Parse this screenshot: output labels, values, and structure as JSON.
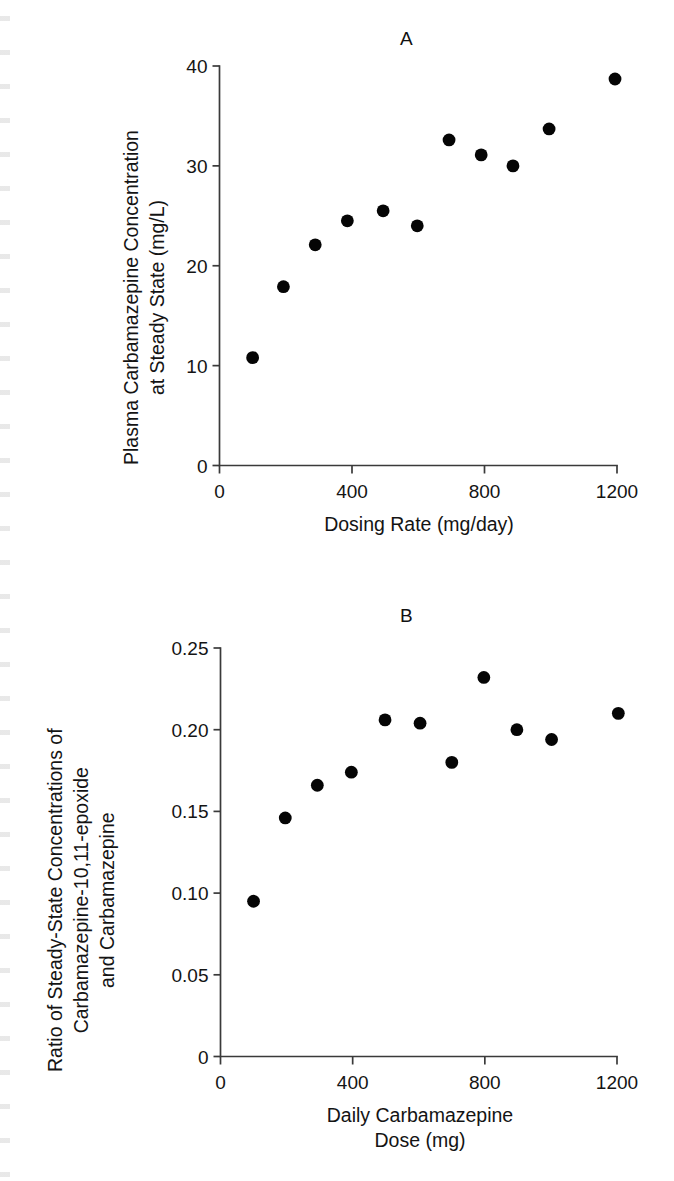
{
  "figure": {
    "background_color": "#ffffff",
    "ink_color": "#141414",
    "marker_color": "#050505",
    "axis_color": "#3a3a3a"
  },
  "panels": [
    {
      "letter": "A",
      "ylabel_lines": [
        "Plasma Carbamazepine Concentration",
        "at Steady State (mg/L)"
      ],
      "xlabel_lines": [
        "Dosing Rate (mg/day)"
      ],
      "yticks": [
        "0",
        "10",
        "20",
        "30",
        "40"
      ],
      "xticks": [
        "0",
        "400",
        "800",
        "1200"
      ]
    },
    {
      "letter": "B",
      "ylabel_lines": [
        "Ratio of Steady-State Concentrations of",
        "Carbamazepine-10,11-epoxide",
        "and Carbamazepine"
      ],
      "xlabel_lines": [
        "Daily Carbamazepine",
        "Dose (mg)"
      ],
      "yticks": [
        "0",
        "0.05",
        "0.10",
        "0.15",
        "0.20",
        "0.25"
      ],
      "xticks": [
        "0",
        "400",
        "800",
        "1200"
      ]
    }
  ],
  "chart_data": [
    {
      "type": "scatter",
      "title": "A",
      "xlabel": "Dosing Rate (mg/day)",
      "ylabel": "Plasma Carbamazepine Concentration at Steady State (mg/L)",
      "xlim": [
        0,
        1200
      ],
      "ylim": [
        0,
        40
      ],
      "xticks": [
        0,
        400,
        800,
        1200
      ],
      "yticks": [
        0,
        10,
        20,
        30,
        40
      ],
      "grid": false,
      "legend": "none",
      "marker": "filled-circle",
      "x": [
        100,
        193,
        289,
        386,
        494,
        597,
        693,
        790,
        886,
        995,
        1194
      ],
      "y": [
        10.8,
        17.9,
        22.1,
        24.5,
        25.5,
        24.0,
        32.6,
        31.1,
        30.0,
        33.7,
        38.7
      ]
    },
    {
      "type": "scatter",
      "title": "B",
      "xlabel": "Daily Carbamazepine Dose (mg)",
      "ylabel": "Ratio of Steady-State Concentrations of Carbamazepine-10,11-epoxide and Carbamazepine",
      "xlim": [
        0,
        1200
      ],
      "ylim": [
        0,
        0.25
      ],
      "xticks": [
        0,
        400,
        800,
        1200
      ],
      "yticks": [
        0,
        0.05,
        0.1,
        0.15,
        0.2,
        0.25
      ],
      "grid": false,
      "legend": "none",
      "marker": "filled-circle",
      "x": [
        100,
        196,
        293,
        396,
        498,
        604,
        700,
        797,
        897,
        1002,
        1204
      ],
      "y": [
        0.095,
        0.146,
        0.166,
        0.174,
        0.206,
        0.204,
        0.18,
        0.232,
        0.2,
        0.194,
        0.21
      ]
    }
  ]
}
